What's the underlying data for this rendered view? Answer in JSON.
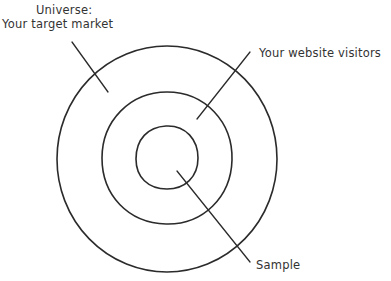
{
  "diagram": {
    "type": "concentric-circles",
    "labels": {
      "universe_line1": "Universe:",
      "universe_line2": "Your target market",
      "visitors": "Your website visitors",
      "sample": "Sample"
    },
    "rings": [
      {
        "name": "universe",
        "label": "Universe: Your target market"
      },
      {
        "name": "website-visitors",
        "label": "Your website visitors"
      },
      {
        "name": "sample",
        "label": "Sample"
      }
    ],
    "colors": {
      "stroke": "#2b2b2b",
      "text": "#333333",
      "background": "#ffffff"
    }
  }
}
